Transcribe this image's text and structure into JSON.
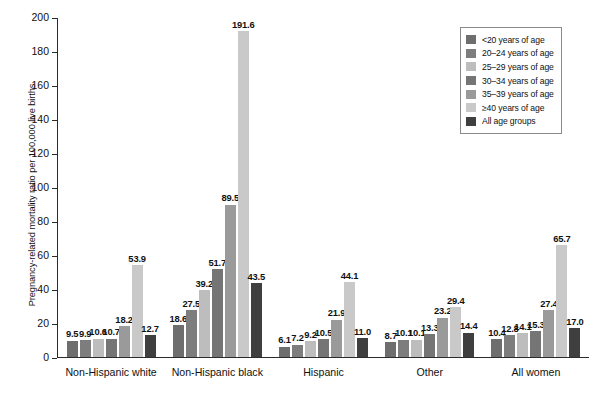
{
  "chart_data": {
    "type": "bar",
    "title": "",
    "subtitle": "",
    "xlabel": "",
    "ylabel": "Pregnancy-related mortality ratio per 100,000 live births",
    "ylim": [
      0,
      200
    ],
    "ytick_step": 20,
    "yticks": [
      "0",
      "20",
      "40",
      "60",
      "80",
      "100",
      "120",
      "140",
      "160",
      "180",
      "200"
    ],
    "grid": false,
    "legend_position": "top-right",
    "categories": [
      "Non-Hispanic white",
      "Non-Hispanic black",
      "Hispanic",
      "Other",
      "All women"
    ],
    "series": [
      {
        "name": "<20 years of age",
        "color": "#6e6e6e",
        "values": [
          9.5,
          18.6,
          6.1,
          8.7,
          10.4
        ]
      },
      {
        "name": "20–24 years of age",
        "color": "#7d7d7d",
        "values": [
          9.9,
          27.5,
          7.2,
          10.1,
          12.8
        ]
      },
      {
        "name": "25–29 years of age",
        "color": "#bdbdbd",
        "values": [
          10.6,
          39.2,
          9.2,
          10.1,
          14.1
        ]
      },
      {
        "name": "30–34 years of age",
        "color": "#757575",
        "values": [
          10.7,
          51.7,
          10.5,
          13.3,
          15.3
        ]
      },
      {
        "name": "35–39 years of age",
        "color": "#9a9a9a",
        "values": [
          18.2,
          89.5,
          21.9,
          23.2,
          27.4
        ]
      },
      {
        "name": "≥40 years of age",
        "color": "#c9c9c9",
        "values": [
          53.9,
          191.6,
          44.1,
          29.4,
          65.7
        ]
      },
      {
        "name": "All age groups",
        "color": "#3f3f3f",
        "values": [
          12.7,
          43.5,
          11.0,
          14.4,
          17.0
        ]
      }
    ],
    "bar_labels": [
      [
        "9.5",
        "9.9",
        "10.6",
        "10.7",
        "18.2",
        "53.9",
        "12.7"
      ],
      [
        "18.6",
        "27.5",
        "39.2",
        "51.7",
        "89.5",
        "191.6",
        "43.5"
      ],
      [
        "6.1",
        "7.2",
        "9.2",
        "10.5",
        "21.9",
        "44.1",
        "11.0"
      ],
      [
        "8.7",
        "10.1",
        "10.1",
        "13.3",
        "23.2",
        "29.4",
        "14.4"
      ],
      [
        "10.4",
        "12.8",
        "14.1",
        "15.3",
        "27.4",
        "65.7",
        "17.0"
      ]
    ]
  },
  "legend": {
    "items": [
      {
        "label": "<20 years of age",
        "color": "#6e6e6e"
      },
      {
        "label": "20–24 years of age",
        "color": "#7d7d7d"
      },
      {
        "label": "25–29 years of age",
        "color": "#bdbdbd"
      },
      {
        "label": "30–34 years of age",
        "color": "#757575"
      },
      {
        "label": "35–39 years of age",
        "color": "#9a9a9a"
      },
      {
        "label": "≥40 years of age",
        "color": "#c9c9c9"
      },
      {
        "label": "All age groups",
        "color": "#3f3f3f"
      }
    ]
  },
  "axes": {
    "y_title": "Pregnancy-related mortality ratio per 100,000 live births"
  },
  "colors": {
    "axis": "#2b2b2b",
    "text": "#111111",
    "legend_border": "#8a8a8a",
    "background": "#ffffff"
  }
}
